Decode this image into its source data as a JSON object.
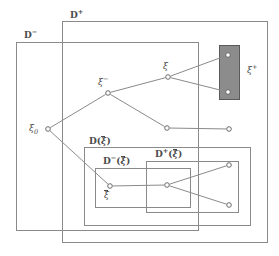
{
  "figure": {
    "type": "set-inclusion-diagram",
    "width": 279,
    "height": 256,
    "background": "#ffffff",
    "stroke_color": "#8a8a8a",
    "text_color": "#4a4a4a",
    "highlight_fill": "#8c8c8c"
  },
  "boxes": [
    {
      "id": "d-plus",
      "label_main": "D",
      "label_sup": "+",
      "label_x": 70,
      "label_y": 11,
      "x": 62,
      "y": 21,
      "w": 205,
      "h": 221
    },
    {
      "id": "d-minus",
      "label_main": "D",
      "label_sup": "−",
      "label_x": 24,
      "label_y": 31,
      "x": 16,
      "y": 42,
      "w": 182,
      "h": 188
    },
    {
      "id": "d-xibar",
      "label_main": "D(",
      "label_mid": "ξ",
      "label_tail": ")",
      "label_x": 89,
      "label_y": 137,
      "x": 84,
      "y": 147,
      "w": 166,
      "h": 78
    },
    {
      "id": "d-minus-xibar",
      "label_main": "D",
      "label_sup": "−",
      "label_mid": "ξ",
      "label_x": 103,
      "label_y": 157,
      "x": 95,
      "y": 168,
      "w": 95,
      "h": 39
    },
    {
      "id": "d-plus-xibar",
      "label_main": "D",
      "label_sup": "+",
      "label_mid": "ξ",
      "label_x": 155,
      "label_y": 150,
      "x": 146,
      "y": 161,
      "w": 92,
      "h": 51
    }
  ],
  "highlight_box": {
    "id": "xi-plus-region",
    "x": 219,
    "y": 45,
    "w": 20,
    "h": 54,
    "fill": "#8c8c8c",
    "stroke": "#5a5a5a"
  },
  "nodes": [
    {
      "id": "xi0",
      "x": 48,
      "y": 129,
      "label": "ξ",
      "label_sub": "0",
      "label_x": 29,
      "label_y": 124,
      "label_pos": "left"
    },
    {
      "id": "xi-minus",
      "x": 108,
      "y": 93,
      "label": "ξ",
      "label_sup": "−",
      "label_x": 98,
      "label_y": 78,
      "label_pos": "above-left"
    },
    {
      "id": "xi",
      "x": 168,
      "y": 77,
      "label": "ξ",
      "label_x": 163,
      "label_y": 62,
      "label_pos": "above"
    },
    {
      "id": "xi-plus-a",
      "x": 228,
      "y": 55,
      "label": "",
      "label_x": 0,
      "label_y": 0,
      "label_pos": "none"
    },
    {
      "id": "xi-plus-b",
      "x": 228,
      "y": 92,
      "label": "",
      "label_x": 0,
      "label_y": 0,
      "label_pos": "none"
    },
    {
      "id": "mid-a",
      "x": 167,
      "y": 128,
      "label": "",
      "label_x": 0,
      "label_y": 0,
      "label_pos": "none"
    },
    {
      "id": "mid-b",
      "x": 229,
      "y": 129,
      "label": "",
      "label_x": 0,
      "label_y": 0,
      "label_pos": "none"
    },
    {
      "id": "xibar",
      "x": 110,
      "y": 186,
      "label": "ξ",
      "label_x": 104,
      "label_y": 191,
      "label_pos": "below",
      "label_overbar": true
    },
    {
      "id": "inner-mid",
      "x": 167,
      "y": 185,
      "label": "",
      "label_x": 0,
      "label_y": 0,
      "label_pos": "none"
    },
    {
      "id": "inner-top",
      "x": 229,
      "y": 165,
      "label": "",
      "label_x": 0,
      "label_y": 0,
      "label_pos": "none"
    },
    {
      "id": "inner-bot",
      "x": 229,
      "y": 205,
      "label": "",
      "label_x": 0,
      "label_y": 0,
      "label_pos": "none"
    }
  ],
  "edges": [
    {
      "from": "xi0",
      "to": "xi-minus"
    },
    {
      "from": "xi-minus",
      "to": "xi"
    },
    {
      "from": "xi",
      "to": "xi-plus-a"
    },
    {
      "from": "xi",
      "to": "xi-plus-b"
    },
    {
      "from": "xi-minus",
      "to": "mid-a"
    },
    {
      "from": "mid-a",
      "to": "mid-b"
    },
    {
      "from": "xi0",
      "to": "xibar"
    },
    {
      "from": "xibar",
      "to": "inner-mid"
    },
    {
      "from": "inner-mid",
      "to": "inner-top"
    },
    {
      "from": "inner-mid",
      "to": "inner-bot"
    }
  ],
  "external_labels": [
    {
      "id": "xi-plus-label",
      "text": "ξ",
      "sup": "+",
      "x": 247,
      "y": 66
    }
  ]
}
